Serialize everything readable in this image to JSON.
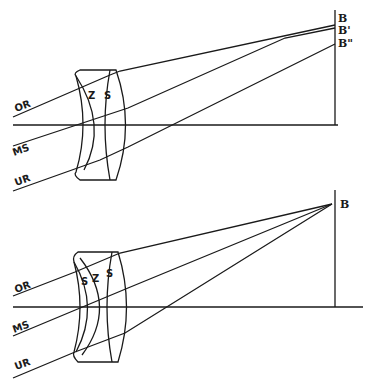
{
  "diagrams": [
    {
      "ray_labels": {
        "upper": "OR",
        "middle": "MS",
        "lower": "UR"
      },
      "lens_labels": {
        "first": "Z",
        "second": "S"
      },
      "image_labels": {
        "b": "B",
        "b1": "B'",
        "b2": "B\""
      }
    },
    {
      "ray_labels": {
        "upper": "OR",
        "middle": "MS",
        "lower": "UR"
      },
      "lens_labels": {
        "first": "S",
        "second": "Z",
        "third": "S"
      },
      "image_labels": {
        "b": "B"
      }
    }
  ]
}
